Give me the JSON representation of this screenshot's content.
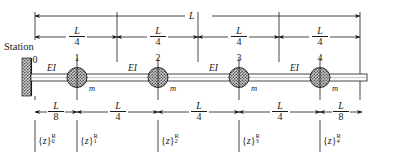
{
  "figure": {
    "type": "structural-beam-diagram",
    "station_word": "Station",
    "support": "fixed-wall",
    "beam_end": "free"
  },
  "dimensions": {
    "overall": {
      "label": "L",
      "value": "L"
    },
    "top_segments": [
      {
        "num": "L",
        "den": "4"
      },
      {
        "num": "L",
        "den": "4"
      },
      {
        "num": "L",
        "den": "4"
      },
      {
        "num": "L",
        "den": "4"
      }
    ],
    "bottom_segments": [
      {
        "num": "L",
        "den": "8"
      },
      {
        "num": "L",
        "den": "4"
      },
      {
        "num": "L",
        "den": "4"
      },
      {
        "num": "L",
        "den": "4"
      },
      {
        "num": "L",
        "den": "8"
      }
    ]
  },
  "stations": [
    {
      "number": "0",
      "kind": "wall"
    },
    {
      "number": "1",
      "kind": "mass"
    },
    {
      "number": "2",
      "kind": "mass"
    },
    {
      "number": "3",
      "kind": "mass"
    },
    {
      "number": "4",
      "kind": "mass"
    }
  ],
  "fields": {
    "segment_label": "EI",
    "segments": [
      "EI",
      "EI",
      "EI",
      "EI"
    ],
    "mass_label": "m",
    "masses": [
      "m",
      "m",
      "m",
      "m"
    ]
  },
  "state_vectors": [
    {
      "brace_open": "{",
      "symbol": "z",
      "brace_close": "}",
      "sub": "0",
      "sup": "R"
    },
    {
      "brace_open": "{",
      "symbol": "z",
      "brace_close": "}",
      "sub": "1",
      "sup": "R"
    },
    {
      "brace_open": "{",
      "symbol": "z",
      "brace_close": "}",
      "sub": "2",
      "sup": "R"
    },
    {
      "brace_open": "{",
      "symbol": "z",
      "brace_close": "}",
      "sub": "3",
      "sup": "R"
    },
    {
      "brace_open": "{",
      "symbol": "z",
      "brace_close": "}",
      "sub": "4",
      "sup": "R"
    }
  ],
  "colors": {
    "ink": "#1a1a1a",
    "mass_fill": "#b0b0b0",
    "wall_fill": "#9a9a9a",
    "beam_fill": "#ffffff"
  }
}
